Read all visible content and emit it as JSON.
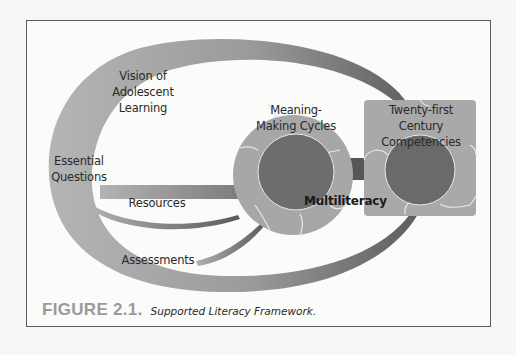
{
  "figure": {
    "number": "FIGURE 2.1.",
    "title": "Supported Literacy Framework."
  },
  "labels": {
    "vision": [
      "Vision of",
      "Adolescent",
      "Learning"
    ],
    "essential_questions": [
      "Essential",
      "Questions"
    ],
    "resources": "Resources",
    "assessments": "Assessments",
    "meaning_making": [
      "Meaning-",
      "Making Cycles"
    ],
    "twenty_first": [
      "Twenty-first",
      "Century",
      "Competencies"
    ],
    "multiliteracy": "Multiliteracy"
  },
  "colors": {
    "background": "#fbfbfa",
    "frame_border": "#5a5a5a",
    "arc_light": "#b8b8b8",
    "arc_dark": "#6e6e6e",
    "ring_gray": "#a9a9a9",
    "inner_dark": "#6b6b6b",
    "connector": "#555555",
    "caption_number": "#9a9a9a"
  }
}
